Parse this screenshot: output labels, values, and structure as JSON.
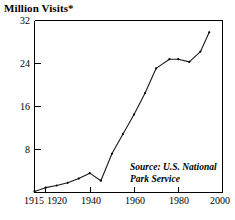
{
  "chart_data": {
    "type": "line",
    "title": "Million Visits*",
    "xlabel": "",
    "ylabel": "",
    "xlim": [
      1915,
      2000
    ],
    "ylim": [
      0,
      32
    ],
    "grid": false,
    "legend": null,
    "x_ticks": [
      1915,
      1920,
      1940,
      1960,
      1980,
      2000
    ],
    "x_tick_labels": [
      "1915",
      "1920",
      "1940",
      "1960",
      "1980",
      "2000"
    ],
    "y_ticks": [
      8,
      16,
      24,
      32
    ],
    "y_tick_labels": [
      "8",
      "16",
      "24",
      "32"
    ],
    "annotations": [
      {
        "name": "source-note",
        "text_line_1": "Source: U.S. National",
        "text_line_2": "Park Service",
        "x": 1963,
        "y": 6.0
      }
    ],
    "series": [
      {
        "name": "National Park Visits",
        "x": [
          1915,
          1920,
          1925,
          1930,
          1935,
          1940,
          1945,
          1950,
          1955,
          1960,
          1965,
          1970,
          1976,
          1980,
          1985,
          1990,
          1994
        ],
        "values": [
          0.2,
          0.9,
          1.3,
          1.8,
          2.6,
          3.6,
          2.2,
          7.2,
          10.9,
          14.5,
          18.5,
          23.1,
          24.8,
          24.8,
          24.3,
          26.2,
          29.8
        ]
      }
    ]
  },
  "labels": {
    "y_axis_top": "32",
    "y_axis_24": "24",
    "y_axis_16": "16",
    "y_axis_8": "8",
    "x_axis_1915": "1915",
    "x_axis_1920": "1920",
    "x_axis_1940": "1940",
    "x_axis_1960": "1960",
    "x_axis_1980": "1980",
    "x_axis_2000": "2000",
    "source_line_1": "Source: U.S. National",
    "source_line_2": "Park Service"
  },
  "colors": {
    "line": "#1a1a1a",
    "axis": "#000000",
    "background": "#ffffff",
    "text": "#000000"
  }
}
